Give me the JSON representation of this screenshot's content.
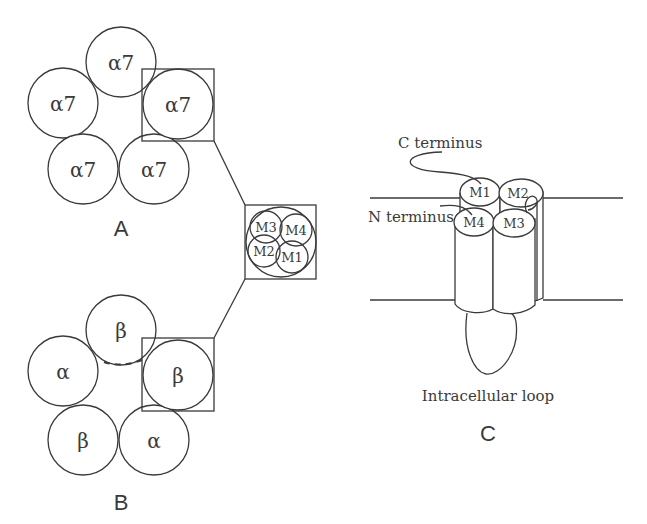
{
  "figure": {
    "panels": {
      "A": {
        "label": "A",
        "subunits": [
          "α7",
          "α7",
          "α7",
          "α7",
          "α7"
        ],
        "description": "homomeric alpha7 pentamer"
      },
      "B": {
        "label": "B",
        "subunits": [
          "β",
          "α",
          "β",
          "β",
          "α"
        ],
        "description": "heteromeric alpha/beta pentamer"
      },
      "inset": {
        "helices": [
          "M3",
          "M4",
          "M2",
          "M1"
        ]
      },
      "C": {
        "label": "C",
        "c_terminus_label": "C terminus",
        "n_terminus_label": "N terminus",
        "helices": [
          "M1",
          "M2",
          "M4",
          "M3"
        ],
        "loop_label": "Intracellular loop"
      }
    },
    "colors": {
      "line": "#3a3a3a",
      "background": "#ffffff"
    }
  }
}
